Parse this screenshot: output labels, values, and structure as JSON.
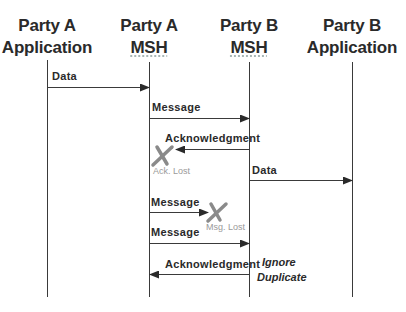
{
  "participants": [
    {
      "line1": "Party A",
      "line2": "Application",
      "x": 47
    },
    {
      "line1": "Party A",
      "line2": "MSH",
      "x": 149
    },
    {
      "line1": "Party B",
      "line2": "MSH",
      "x": 249
    },
    {
      "line1": "Party B",
      "line2": "Application",
      "x": 352
    }
  ],
  "messages": [
    {
      "label": "Data",
      "from": "Party A Application",
      "to": "Party A MSH",
      "status": "delivered"
    },
    {
      "label": "Message",
      "from": "Party A MSH",
      "to": "Party B MSH",
      "status": "delivered"
    },
    {
      "label": "Acknowledgment",
      "from": "Party B MSH",
      "to": "Party A MSH",
      "status": "lost",
      "lost_label": "Ack. Lost"
    },
    {
      "label": "Data",
      "from": "Party B MSH",
      "to": "Party B Application",
      "status": "delivered"
    },
    {
      "label": "Message",
      "from": "Party A MSH",
      "to": "Party B MSH",
      "status": "lost",
      "lost_label": "Msg. Lost"
    },
    {
      "label": "Message",
      "from": "Party A MSH",
      "to": "Party B MSH",
      "status": "delivered"
    },
    {
      "label": "Acknowledgment",
      "from": "Party B MSH",
      "to": "Party A MSH",
      "status": "delivered"
    }
  ],
  "notes": {
    "ignore_duplicate": {
      "line1": "Ignore",
      "line2": "Duplicate"
    }
  },
  "colors": {
    "line": "#3a3a3a",
    "text": "#2a2a2a",
    "lost_mark": "#8a8a8a",
    "lost_text": "#9a9a9a"
  }
}
